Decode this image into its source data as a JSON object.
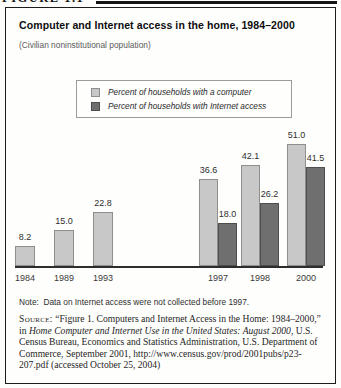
{
  "figure_label": "FIGURE 1.1",
  "header": {
    "title": "Computer and Internet access in the home, 1984–2000",
    "subtitle": "(Civilian noninstitutional population)"
  },
  "legend": [
    {
      "label": "Percent of households with a computer",
      "color": "#c8c8c8",
      "border": "#8e8e8e"
    },
    {
      "label": "Percent of households with Internet access",
      "color": "#6f6f6f",
      "border": "#4e4e4e"
    }
  ],
  "chart_data": {
    "type": "bar",
    "title": "Computer and Internet access in the home, 1984–2000",
    "xlabel": "",
    "ylabel": "",
    "categories": [
      "1984",
      "1989",
      "1993",
      "1997",
      "1998",
      "2000"
    ],
    "series": [
      {
        "name": "Percent of households with a computer",
        "color": "#c8c8c8",
        "values": [
          8.2,
          15.0,
          22.8,
          36.6,
          42.1,
          51.0
        ]
      },
      {
        "name": "Percent of households with Internet access",
        "color": "#6f6f6f",
        "values": [
          null,
          null,
          null,
          18.0,
          26.2,
          41.5
        ]
      }
    ],
    "value_labels": true,
    "ylim": [
      0,
      55
    ],
    "grid": false,
    "legend_position": "top-center"
  },
  "note": "Note:  Data on Internet access were not collected before 1997.",
  "source": {
    "segments": [
      {
        "text": "Source:",
        "style": "smallcaps"
      },
      {
        "text": " “Figure 1. Computers and Internet Access in the Home: 1984–2000,” in ",
        "style": "normal"
      },
      {
        "text": "Home Computer and Internet Use in the United States: August 2000",
        "style": "italic"
      },
      {
        "text": ", U.S. Census Bureau, Economics and Statistics Administration, U.S. Department of Commerce, September 2001, http://www.census.gov/prod/2001pubs/p23-207.pdf (accessed October 25, 2004)",
        "style": "normal"
      }
    ]
  },
  "colors": {
    "bar_computer": "#c8c8c8",
    "bar_internet": "#6f6f6f",
    "box_border": "#1c1c1c",
    "axis": "#2d2d2d"
  }
}
